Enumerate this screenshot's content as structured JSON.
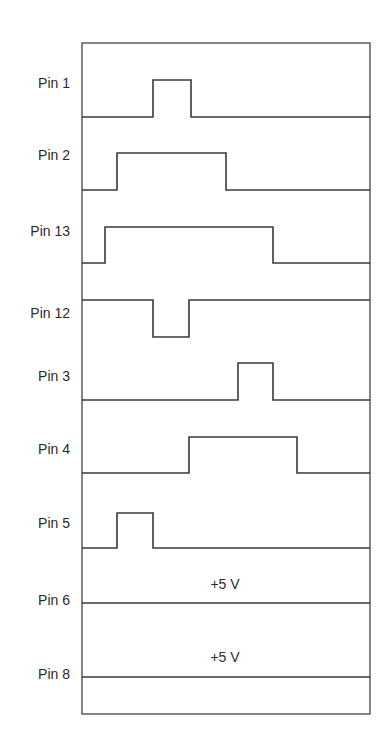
{
  "diagram": {
    "type": "timing",
    "frame": {
      "x1": 82,
      "x2": 370,
      "top": 43,
      "bottom": 714
    },
    "signals": [
      {
        "label": "Pin 1",
        "label_y": 88,
        "low_y": 117,
        "high_y": 80,
        "initial": "low",
        "transitions": [
          153,
          191
        ]
      },
      {
        "label": "Pin 2",
        "label_y": 160,
        "low_y": 190,
        "high_y": 153,
        "initial": "low",
        "transitions": [
          117,
          226
        ]
      },
      {
        "label": "Pin 13",
        "label_y": 236,
        "low_y": 263,
        "high_y": 227,
        "initial": "low",
        "transitions": [
          105,
          273
        ]
      },
      {
        "label": "Pin 12",
        "label_y": 318,
        "low_y": 337,
        "high_y": 300,
        "initial": "high",
        "transitions": [
          153,
          189
        ]
      },
      {
        "label": "Pin 3",
        "label_y": 381,
        "low_y": 400,
        "high_y": 363,
        "initial": "low",
        "transitions": [
          238,
          273
        ]
      },
      {
        "label": "Pin 4",
        "label_y": 454,
        "low_y": 473,
        "high_y": 437,
        "initial": "low",
        "transitions": [
          189,
          297
        ]
      },
      {
        "label": "Pin 5",
        "label_y": 528,
        "low_y": 548,
        "high_y": 513,
        "initial": "low",
        "transitions": [
          117,
          153
        ]
      },
      {
        "label": "Pin 6",
        "label_y": 605,
        "low_y": 603,
        "high_y": 603,
        "initial": "low",
        "transitions": [],
        "annotation": "+5 V",
        "annotation_y": 589
      },
      {
        "label": "Pin 8",
        "label_y": 679,
        "low_y": 677,
        "high_y": 677,
        "initial": "low",
        "transitions": [],
        "annotation": "+5 V",
        "annotation_y": 662
      }
    ]
  }
}
